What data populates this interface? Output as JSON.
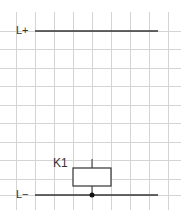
{
  "diagram": {
    "type": "circuit-schematic",
    "grid": {
      "color": "#d4d4d4",
      "x_lines": [
        16,
        35,
        54,
        73,
        92,
        111,
        130,
        149,
        168
      ],
      "y_lines": [
        12,
        31,
        49,
        68,
        86,
        105,
        123,
        142,
        160,
        179,
        197
      ]
    },
    "rails": [
      {
        "label": "L+",
        "y": 31,
        "x1": 35,
        "x2": 158
      },
      {
        "label": "L−",
        "y": 195,
        "x1": 35,
        "x2": 158
      }
    ],
    "components": [
      {
        "id": "K1",
        "label": "K1",
        "type": "relay-coil",
        "x": 73,
        "y": 168,
        "w": 38,
        "h": 18
      }
    ],
    "junction": {
      "x": 92,
      "y": 195
    },
    "line_color": "#333333"
  }
}
